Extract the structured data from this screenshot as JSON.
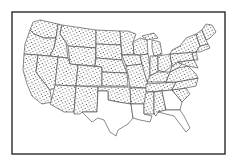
{
  "map": {
    "title": "",
    "subject": "United States (contiguous) state outline map",
    "style": "line drawing with stippled (dot-pattern) fill",
    "colors": {
      "line": "#2e2e2e",
      "background": "#ffffff",
      "dots": "#333333"
    },
    "frame": {
      "visible": true
    },
    "regions": {
      "stippled": [
        "Washington",
        "Oregon",
        "California",
        "Idaho",
        "Nevada",
        "Montana",
        "Wyoming",
        "Utah",
        "Arizona",
        "Colorado",
        "New Mexico",
        "North Dakota",
        "South Dakota",
        "Nebraska",
        "Kansas",
        "Oklahoma",
        "Minnesota",
        "Iowa",
        "Missouri",
        "Arkansas",
        "Wisconsin",
        "Illinois",
        "Michigan",
        "Indiana",
        "Ohio",
        "Kentucky",
        "Tennessee",
        "Mississippi",
        "Alabama",
        "West Virginia",
        "Virginia",
        "North Carolina",
        "South Carolina",
        "Pennsylvania",
        "New York",
        "Maine",
        "Vermont",
        "New Hampshire",
        "Massachusetts",
        "Connecticut",
        "Rhode Island",
        "New Jersey",
        "Delaware",
        "Maryland"
      ],
      "unstippled": [
        "Texas",
        "Louisiana",
        "Georgia",
        "Florida"
      ]
    }
  }
}
